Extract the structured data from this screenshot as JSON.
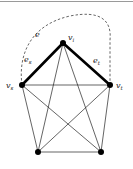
{
  "diagram": {
    "type": "graph",
    "vertices": [
      {
        "id": "vi",
        "label": "v",
        "sub": "i",
        "x": 63,
        "y": 43
      },
      {
        "id": "vs",
        "label": "v",
        "sub": "s",
        "x": 22,
        "y": 85
      },
      {
        "id": "vt",
        "label": "v",
        "sub": "t",
        "x": 110,
        "y": 85
      },
      {
        "id": "bl",
        "label": "",
        "sub": "",
        "x": 38,
        "y": 152
      },
      {
        "id": "br",
        "label": "",
        "sub": "",
        "x": 101,
        "y": 152
      }
    ],
    "bold_edges": [
      {
        "from": "vs",
        "to": "vi",
        "label": "e",
        "sub": "s"
      },
      {
        "from": "vi",
        "to": "vt",
        "label": "e",
        "sub": "t"
      }
    ],
    "dashed_edge": {
      "from": "vs",
      "to": "vt",
      "label": "e"
    },
    "thin_edges": [
      [
        "vs",
        "vt"
      ],
      [
        "vs",
        "bl"
      ],
      [
        "vs",
        "br"
      ],
      [
        "vt",
        "bl"
      ],
      [
        "vt",
        "br"
      ],
      [
        "bl",
        "br"
      ],
      [
        "vi",
        "bl"
      ],
      [
        "vi",
        "br"
      ]
    ],
    "colors": {
      "stroke": "#111111",
      "dashed": "#555555"
    }
  }
}
